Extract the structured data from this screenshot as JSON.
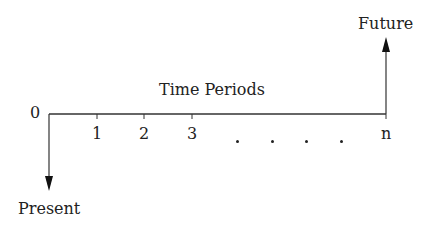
{
  "diagram": {
    "type": "cash-flow-timeline",
    "labels": {
      "future": "Future",
      "present": "Present",
      "axis_title": "Time Periods",
      "origin": "0"
    },
    "ticks": [
      {
        "label": "1"
      },
      {
        "label": "2"
      },
      {
        "label": "3"
      },
      {
        "label": "n"
      }
    ],
    "ellipsis_dots": 4,
    "colors": {
      "line": "#333333",
      "text": "#222222",
      "background": "#ffffff"
    }
  }
}
